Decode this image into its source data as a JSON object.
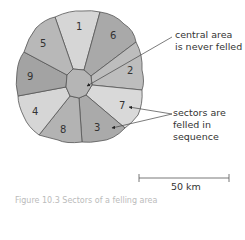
{
  "diagram": {
    "sectors": [
      {
        "label": "1",
        "color": "#d6d6d6"
      },
      {
        "label": "6",
        "color": "#a9a9a9"
      },
      {
        "label": "2",
        "color": "#bdbdbd"
      },
      {
        "label": "7",
        "color": "#d9d9d9"
      },
      {
        "label": "3",
        "color": "#aaaaaa"
      },
      {
        "label": "8",
        "color": "#b3b3b3"
      },
      {
        "label": "4",
        "color": "#d6d6d6"
      },
      {
        "label": "9",
        "color": "#a3a3a3"
      },
      {
        "label": "5",
        "color": "#b8b8b8"
      }
    ],
    "center_color": "#b5b5b5",
    "outline_color": "#555555",
    "annotations": {
      "central": {
        "line1": "central area",
        "line2": "is never felled"
      },
      "sectors": {
        "line1": "sectors are",
        "line2": "felled in",
        "line3": "sequence"
      }
    },
    "scale_bar": {
      "label": "50 km"
    },
    "caption": "Figure 10.3 Sectors of a felling area"
  }
}
